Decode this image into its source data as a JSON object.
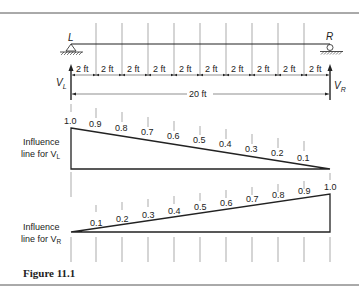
{
  "figure": {
    "caption": "Figure 11.1",
    "beam": {
      "left_support": "L",
      "right_support": "R",
      "span_label": "20 ft",
      "segment_label": "2 ft",
      "segments": 10,
      "left_reaction": "V",
      "left_reaction_sub": "L",
      "right_reaction": "V",
      "right_reaction_sub": "R"
    },
    "influence_VL": {
      "label_line1": "Influence",
      "label_line2": "line for V",
      "label_sub": "L",
      "ordinates": [
        "1.0",
        "0.9",
        "0.8",
        "0.7",
        "0.6",
        "0.5",
        "0.4",
        "0.3",
        "0.2",
        "0.1"
      ]
    },
    "influence_VR": {
      "label_line1": "Influence",
      "label_line2": "line for V",
      "label_sub": "R",
      "ordinates": [
        "0.1",
        "0.2",
        "0.3",
        "0.4",
        "0.5",
        "0.6",
        "0.7",
        "0.8",
        "0.9",
        "1.0"
      ]
    }
  }
}
